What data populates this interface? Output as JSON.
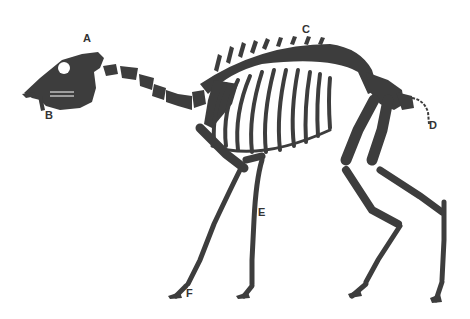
{
  "diagram": {
    "bone_color": "#3d3d3d",
    "background": "#ffffff",
    "labels": [
      {
        "id": "A",
        "text": "A",
        "x": 83,
        "y": 33
      },
      {
        "id": "B",
        "text": "B",
        "x": 45,
        "y": 110
      },
      {
        "id": "C",
        "text": "C",
        "x": 302,
        "y": 24
      },
      {
        "id": "D",
        "text": "D",
        "x": 429,
        "y": 120
      },
      {
        "id": "E",
        "text": "E",
        "x": 258,
        "y": 207
      },
      {
        "id": "F",
        "text": "F",
        "x": 186,
        "y": 288
      }
    ]
  }
}
